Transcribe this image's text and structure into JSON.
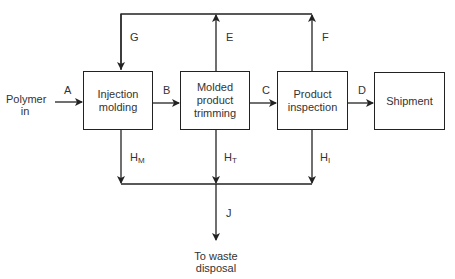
{
  "diagram": {
    "type": "process-flow",
    "input": {
      "label": "Polymer in"
    },
    "nodes": [
      {
        "id": "injection",
        "label": "Injection molding"
      },
      {
        "id": "trimming",
        "label": "Molded product trimming"
      },
      {
        "id": "inspection",
        "label": "Product inspection"
      },
      {
        "id": "shipment",
        "label": "Shipment"
      }
    ],
    "streams": {
      "A": "A",
      "B": "B",
      "C": "C",
      "D": "D",
      "E": "E",
      "F": "F",
      "G": "G",
      "HM": {
        "main": "H",
        "sub": "M"
      },
      "HT": {
        "main": "H",
        "sub": "T"
      },
      "HI": {
        "main": "H",
        "sub": "I"
      },
      "J": "J"
    },
    "output": {
      "line1": "To waste",
      "line2": "disposal"
    },
    "edges": [
      {
        "from": "input",
        "to": "injection",
        "label": "A"
      },
      {
        "from": "injection",
        "to": "trimming",
        "label": "B"
      },
      {
        "from": "trimming",
        "to": "inspection",
        "label": "C"
      },
      {
        "from": "inspection",
        "to": "shipment",
        "label": "D"
      },
      {
        "from": "trimming",
        "to": "recycle",
        "label": "E"
      },
      {
        "from": "inspection",
        "to": "recycle",
        "label": "F"
      },
      {
        "from": "recycle",
        "to": "injection",
        "label": "G"
      },
      {
        "from": "injection",
        "to": "waste-header",
        "label": "HM"
      },
      {
        "from": "trimming",
        "to": "waste-header",
        "label": "HT"
      },
      {
        "from": "inspection",
        "to": "waste-header",
        "label": "HI"
      },
      {
        "from": "waste-header",
        "to": "waste",
        "label": "J"
      }
    ]
  }
}
